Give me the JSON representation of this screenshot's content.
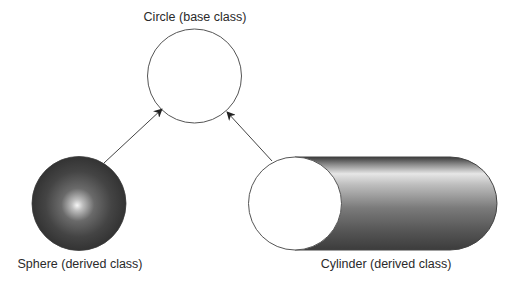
{
  "diagram": {
    "title": "",
    "nodes": [
      {
        "id": "circle",
        "label": "Circle (base class)",
        "shape": "circle",
        "fill": "#ffffff",
        "role": "base class"
      },
      {
        "id": "sphere",
        "label": "Sphere (derived class)",
        "shape": "shaded-sphere",
        "fill": "#3a3a3a",
        "highlight": "#f4f4f4",
        "role": "derived class"
      },
      {
        "id": "cylinder",
        "label": "Cylinder (derived class)",
        "shape": "cylinder",
        "fill": "#4a4a4a",
        "face_fill": "#ffffff",
        "role": "derived class"
      }
    ],
    "edges": [
      {
        "from": "sphere",
        "to": "circle",
        "style": "arrow",
        "meaning": "inherits from"
      },
      {
        "from": "cylinder",
        "to": "circle",
        "style": "arrow",
        "meaning": "inherits from"
      }
    ],
    "colors": {
      "stroke": "#555555",
      "arrow": "#222222",
      "text": "#2a2a2a",
      "background": "#ffffff"
    }
  }
}
